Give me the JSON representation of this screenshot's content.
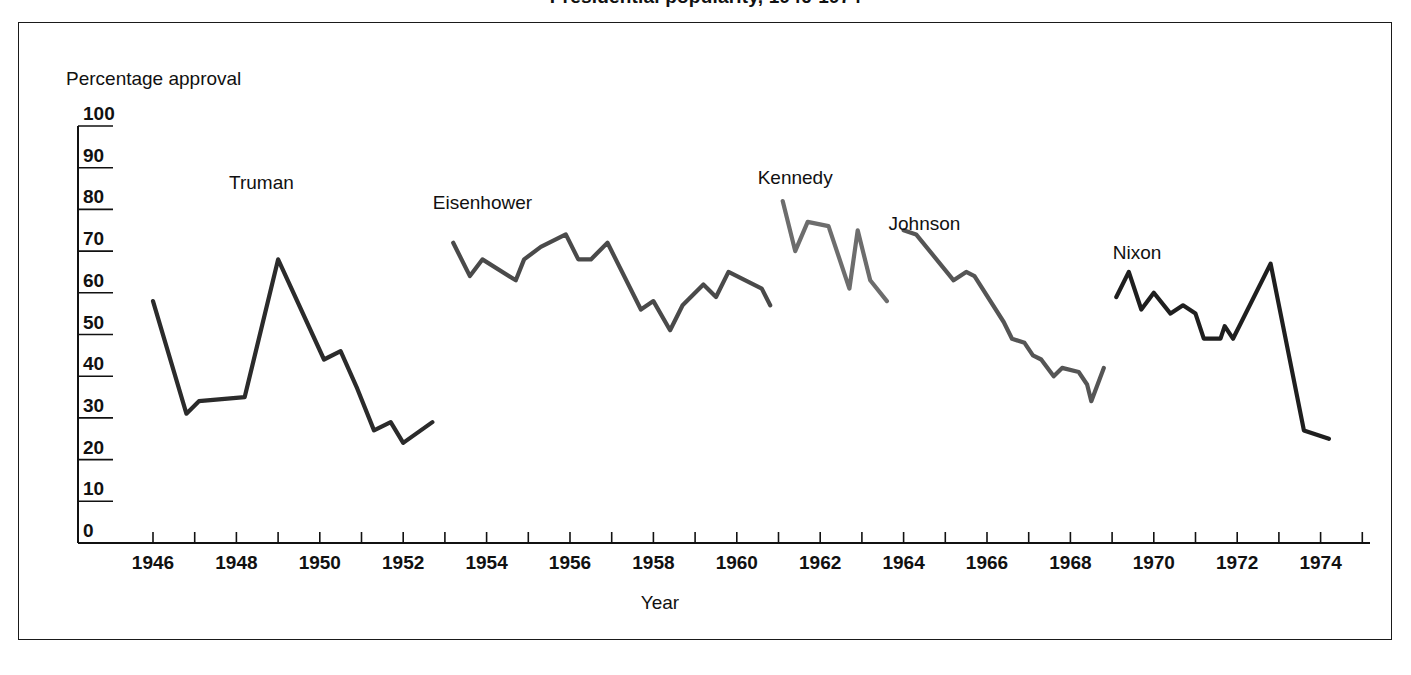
{
  "figure": {
    "title": "Presidential popularity, 1946-1974",
    "title_clipped": true,
    "border_color": "#1a1a1a",
    "background": "#ffffff"
  },
  "chart_data": {
    "type": "line",
    "title": "Presidential popularity, 1946-1974",
    "xlabel": "Year",
    "ylabel": "Percentage approval",
    "xlim": [
      1945,
      1976
    ],
    "ylim": [
      0,
      100
    ],
    "grid": false,
    "legend": "inline-labels",
    "y_ticks": [
      0,
      10,
      20,
      30,
      40,
      50,
      60,
      70,
      80,
      90,
      100
    ],
    "y_tick_labels": [
      "0",
      "10",
      "20",
      "30",
      "40",
      "50",
      "60",
      "70",
      "80",
      "90",
      "100"
    ],
    "x_ticks": [
      1946,
      1947,
      1948,
      1949,
      1950,
      1951,
      1952,
      1953,
      1954,
      1955,
      1956,
      1957,
      1958,
      1959,
      1960,
      1961,
      1962,
      1963,
      1964,
      1965,
      1966,
      1967,
      1968,
      1969,
      1970,
      1971,
      1972,
      1973,
      1974,
      1975
    ],
    "x_tick_labels": [
      "1946",
      "1948",
      "1950",
      "1952",
      "1954",
      "1956",
      "1958",
      "1960",
      "1962",
      "1964",
      "1966",
      "1968",
      "1970",
      "1972",
      "1974"
    ],
    "x_tick_label_years": [
      1946,
      1948,
      1950,
      1952,
      1954,
      1956,
      1958,
      1960,
      1962,
      1964,
      1966,
      1968,
      1970,
      1972,
      1974
    ],
    "series": [
      {
        "name": "Truman",
        "color": "#2b2b2b",
        "label_x": 1948.6,
        "label_y": 85,
        "points": [
          [
            1946.0,
            58
          ],
          [
            1946.8,
            31
          ],
          [
            1947.1,
            34
          ],
          [
            1948.2,
            35
          ],
          [
            1949.0,
            68
          ],
          [
            1950.1,
            44
          ],
          [
            1950.5,
            46
          ],
          [
            1950.9,
            37
          ],
          [
            1951.3,
            27
          ],
          [
            1951.7,
            29
          ],
          [
            1952.0,
            24
          ],
          [
            1952.7,
            29
          ]
        ]
      },
      {
        "name": "Eisenhower",
        "color": "#4a4a4a",
        "label_x": 1953.9,
        "label_y": 80,
        "points": [
          [
            1953.2,
            72
          ],
          [
            1953.6,
            64
          ],
          [
            1953.9,
            68
          ],
          [
            1954.7,
            63
          ],
          [
            1954.9,
            68
          ],
          [
            1955.3,
            71
          ],
          [
            1955.9,
            74
          ],
          [
            1956.2,
            68
          ],
          [
            1956.5,
            68
          ],
          [
            1956.9,
            72
          ],
          [
            1957.7,
            56
          ],
          [
            1958.0,
            58
          ],
          [
            1958.4,
            51
          ],
          [
            1958.7,
            57
          ],
          [
            1959.2,
            62
          ],
          [
            1959.5,
            59
          ],
          [
            1959.8,
            65
          ],
          [
            1960.6,
            61
          ],
          [
            1960.8,
            57
          ]
        ]
      },
      {
        "name": "Kennedy",
        "color": "#6d6d6d",
        "label_x": 1961.4,
        "label_y": 86,
        "points": [
          [
            1961.1,
            82
          ],
          [
            1961.4,
            70
          ],
          [
            1961.7,
            77
          ],
          [
            1962.2,
            76
          ],
          [
            1962.7,
            61
          ],
          [
            1962.9,
            75
          ],
          [
            1963.2,
            63
          ],
          [
            1963.6,
            58
          ]
        ]
      },
      {
        "name": "Johnson",
        "color": "#555555",
        "label_x": 1964.5,
        "label_y": 75,
        "points": [
          [
            1964.0,
            75
          ],
          [
            1964.3,
            74
          ],
          [
            1965.2,
            63
          ],
          [
            1965.5,
            65
          ],
          [
            1965.7,
            64
          ],
          [
            1966.4,
            53
          ],
          [
            1966.6,
            49
          ],
          [
            1966.9,
            48
          ],
          [
            1967.1,
            45
          ],
          [
            1967.3,
            44
          ],
          [
            1967.6,
            40
          ],
          [
            1967.8,
            42
          ],
          [
            1968.2,
            41
          ],
          [
            1968.4,
            38
          ],
          [
            1968.5,
            34
          ],
          [
            1968.8,
            42
          ]
        ]
      },
      {
        "name": "Nixon",
        "color": "#1f1f1f",
        "label_x": 1969.6,
        "label_y": 68,
        "points": [
          [
            1969.1,
            59
          ],
          [
            1969.4,
            65
          ],
          [
            1969.7,
            56
          ],
          [
            1970.0,
            60
          ],
          [
            1970.4,
            55
          ],
          [
            1970.7,
            57
          ],
          [
            1971.0,
            55
          ],
          [
            1971.2,
            49
          ],
          [
            1971.6,
            49
          ],
          [
            1971.7,
            52
          ],
          [
            1971.9,
            49
          ],
          [
            1972.8,
            67
          ],
          [
            1973.6,
            27
          ],
          [
            1974.2,
            25
          ]
        ]
      }
    ]
  },
  "axes": {
    "y_axis_name": "Percentage approval",
    "x_axis_name": "Year"
  }
}
